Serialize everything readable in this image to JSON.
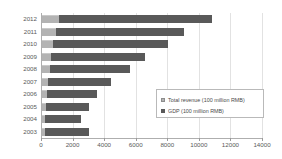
{
  "chart_data": {
    "type": "bar",
    "orientation": "horizontal",
    "stacked": true,
    "title": "",
    "xlabel": "",
    "ylabel": "",
    "xlim": [
      0,
      14000
    ],
    "xticks": [
      0,
      2000,
      4000,
      6000,
      8000,
      10000,
      12000,
      14000
    ],
    "xtick_labels": [
      "0",
      "2000",
      "4000",
      "6000",
      "8000",
      "10000",
      "12000",
      "14000"
    ],
    "grid": true,
    "legend_position": "lower-right",
    "categories": [
      "2012",
      "2011",
      "2010",
      "2009",
      "2008",
      "2007",
      "2006",
      "2005",
      "2004",
      "2003"
    ],
    "series": [
      {
        "name": "Total revenue (100 million RMB)",
        "color": "#b3b3b3",
        "values": [
          1080,
          900,
          690,
          560,
          490,
          390,
          300,
          240,
          200,
          170
        ]
      },
      {
        "name": "GDP (100 million RMB)",
        "color": "#595959",
        "values": [
          9720,
          8100,
          7310,
          5940,
          5110,
          4010,
          3200,
          2760,
          2300,
          2830
        ]
      }
    ],
    "totals": [
      10800,
      9000,
      8000,
      6500,
      5600,
      4400,
      3500,
      3000,
      2500,
      3000
    ]
  },
  "legend": {
    "items": [
      {
        "label": "Total revenue (100 million RMB)",
        "icon": "legend-swatch-revenue"
      },
      {
        "label": "GDP (100 million RMB)",
        "icon": "legend-swatch-gdp"
      }
    ]
  },
  "axis": {
    "x_ticks": [
      "0",
      "2000",
      "4000",
      "6000",
      "8000",
      "10000",
      "12000",
      "14000"
    ],
    "y_ticks": [
      "2012",
      "2011",
      "2010",
      "2009",
      "2008",
      "2007",
      "2006",
      "2005",
      "2004",
      "2003"
    ]
  }
}
